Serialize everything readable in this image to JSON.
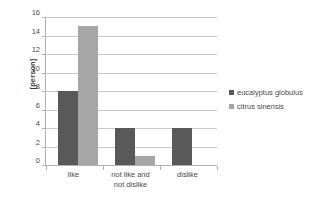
{
  "chart_data": {
    "type": "bar",
    "title": "",
    "xlabel": "",
    "ylabel": "[person]",
    "categories": [
      "like",
      "not like and\nnot dislike",
      "dislike"
    ],
    "series": [
      {
        "name": "eucalyptus globulus",
        "color": "#595959",
        "values": [
          8,
          4,
          4
        ]
      },
      {
        "name": "citrus sinensis",
        "color": "#a6a6a6",
        "values": [
          15,
          1,
          0
        ]
      }
    ],
    "ylim": [
      0,
      16
    ],
    "ytick_step": 2,
    "yticks": [
      0,
      2,
      4,
      6,
      8,
      10,
      12,
      14,
      16
    ],
    "ytick_labels": [
      "0",
      "2",
      "4",
      "6",
      "8",
      "10",
      "12",
      "14",
      "16"
    ],
    "grid": "horizontal",
    "legend_position": "right"
  },
  "legend": {
    "entries": [
      {
        "label": "eucalyptus globulus"
      },
      {
        "label": "citrus sinensis"
      }
    ]
  }
}
